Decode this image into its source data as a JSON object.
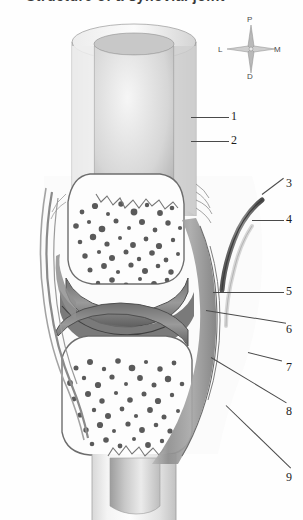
{
  "title": "Structure of a synovial joint",
  "figure": {
    "name": "longitudinal-section-of-synovial-joint",
    "background_color": "#fefefe",
    "ink_color": "#4a4a4a"
  },
  "compass": {
    "name": "anatomical-orientation-rose",
    "north": "P",
    "west": "L",
    "east": "M",
    "south": "D"
  },
  "callouts": [
    {
      "number": "1",
      "x": 231,
      "y": 110,
      "lead_x": 191,
      "lead_y": 117,
      "lead_len": 38,
      "lead_angle": 0
    },
    {
      "number": "2",
      "x": 231,
      "y": 134,
      "lead_x": 191,
      "lead_y": 141,
      "lead_len": 38,
      "lead_angle": 0
    },
    {
      "number": "3",
      "x": 286,
      "y": 177,
      "lead_x": 262,
      "lead_y": 194,
      "lead_len": 27,
      "lead_angle": -37
    },
    {
      "number": "4",
      "x": 286,
      "y": 213,
      "lead_x": 252,
      "lead_y": 220,
      "lead_len": 32,
      "lead_angle": 0
    },
    {
      "number": "5",
      "x": 286,
      "y": 285,
      "lead_x": 213,
      "lead_y": 292,
      "lead_len": 71,
      "lead_angle": 0
    },
    {
      "number": "6",
      "x": 286,
      "y": 323,
      "lead_x": 206,
      "lead_y": 310,
      "lead_len": 81,
      "lead_angle": 9
    },
    {
      "number": "7",
      "x": 286,
      "y": 361,
      "lead_x": 248,
      "lead_y": 352,
      "lead_len": 35,
      "lead_angle": 14
    },
    {
      "number": "8",
      "x": 286,
      "y": 405,
      "lead_x": 211,
      "lead_y": 357,
      "lead_len": 88,
      "lead_angle": 31
    },
    {
      "number": "9",
      "x": 286,
      "y": 471,
      "lead_x": 226,
      "lead_y": 405,
      "lead_len": 90,
      "lead_angle": 44
    }
  ]
}
